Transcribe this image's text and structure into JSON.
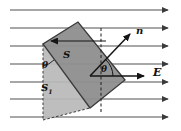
{
  "figure": {
    "labels": {
      "normal_vector": "n",
      "field_vector": "E",
      "surface_area": "S",
      "projected_area_base": "S",
      "projected_area_sub": "1",
      "angle_left": "θ",
      "angle_center": "θ"
    },
    "colors": {
      "surface_fill": "#8e8e8e",
      "projection_fill": "#b9b9b9",
      "field_line": "#7b7b7b",
      "outline": "#3a3a3a",
      "vector": "#1a1a1a",
      "background": "#ffffff"
    },
    "field_lines": {
      "count": 7,
      "y_positions": [
        10,
        28,
        46,
        64,
        82,
        99,
        117
      ],
      "x_start": 10,
      "x_end": 174,
      "direction": "right"
    },
    "surface_polygon": "78,22 43,44 90,108 125,80",
    "projection_polygon": "43,44 43,120 90,108",
    "normal_arrow": {
      "x1": 90,
      "y1": 76,
      "x2": 133,
      "y2": 31
    },
    "field_arrow": {
      "x1": 90,
      "y1": 76,
      "x2": 148,
      "y2": 76
    },
    "in_plane_arrow": {
      "x1": 106,
      "y1": 41,
      "x2": 49,
      "y2": 41
    }
  }
}
